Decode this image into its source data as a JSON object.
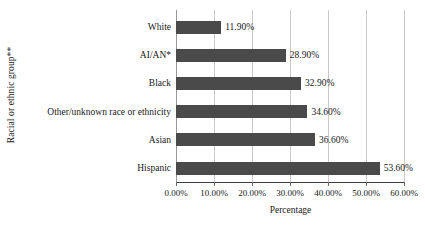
{
  "chart_data": {
    "type": "bar",
    "orientation": "horizontal",
    "title": "",
    "xlabel": "Percentage",
    "ylabel": "Racial or ethnic group**",
    "categories": [
      "White",
      "AI/AN*",
      "Black",
      "Other/unknown race or ethnicity",
      "Asian",
      "Hispanic"
    ],
    "values": [
      11.9,
      28.9,
      32.9,
      34.6,
      36.6,
      53.6
    ],
    "value_labels": [
      "11.90%",
      "28.90%",
      "32.90%",
      "34.60%",
      "36.60%",
      "53.60%"
    ],
    "xlim": [
      0,
      60
    ],
    "xticks": [
      0,
      10,
      20,
      30,
      40,
      50,
      60
    ],
    "xtick_labels": [
      "0.00%",
      "10.00%",
      "20.00%",
      "30.00%",
      "40.00%",
      "50.00%",
      "60.00%"
    ],
    "grid": "vertical",
    "legend": "none",
    "bar_color": "#4a4a4a",
    "gridline_color": "#c9c9c9",
    "axis_color": "#3d3d3d"
  }
}
